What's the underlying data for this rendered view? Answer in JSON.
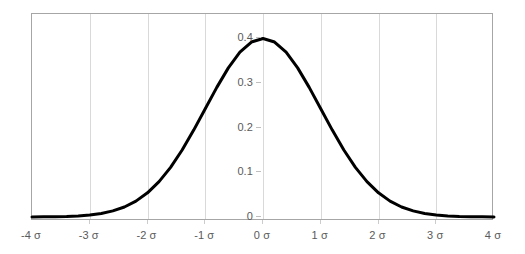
{
  "chart_data": {
    "type": "line",
    "title": "",
    "subtitle": "",
    "xlabel": "",
    "ylabel": "",
    "xlim": [
      -4,
      4
    ],
    "ylim": [
      0,
      0.42
    ],
    "grid": "vertical-only",
    "legend": "none",
    "series": [
      {
        "name": "standard normal pdf",
        "color": "#000000",
        "line_width": 3,
        "x": [
          -4,
          -3.8,
          -3.6,
          -3.4,
          -3.2,
          -3,
          -2.8,
          -2.6,
          -2.4,
          -2.2,
          -2,
          -1.8,
          -1.6,
          -1.4,
          -1.2,
          -1,
          -0.8,
          -0.6,
          -0.4,
          -0.2,
          0,
          0.2,
          0.4,
          0.6,
          0.8,
          1,
          1.2,
          1.4,
          1.6,
          1.8,
          2,
          2.2,
          2.4,
          2.6,
          2.8,
          3,
          3.2,
          3.4,
          3.6,
          3.8,
          4
        ],
        "values": [
          0.0001,
          0.0003,
          0.0006,
          0.0012,
          0.0024,
          0.0044,
          0.0079,
          0.0136,
          0.0224,
          0.0355,
          0.054,
          0.079,
          0.1109,
          0.1497,
          0.1942,
          0.242,
          0.2897,
          0.3332,
          0.3683,
          0.391,
          0.3989,
          0.391,
          0.3683,
          0.3332,
          0.2897,
          0.242,
          0.1942,
          0.1497,
          0.1109,
          0.079,
          0.054,
          0.0355,
          0.0224,
          0.0136,
          0.0079,
          0.0044,
          0.0024,
          0.0012,
          0.0006,
          0.0003,
          0.0001
        ]
      }
    ],
    "x_ticks": [
      {
        "value": -4,
        "label": "-4 σ"
      },
      {
        "value": -3,
        "label": "-3 σ"
      },
      {
        "value": -2,
        "label": "-2 σ"
      },
      {
        "value": -1,
        "label": "-1 σ"
      },
      {
        "value": 0,
        "label": "0 σ"
      },
      {
        "value": 1,
        "label": "1 σ"
      },
      {
        "value": 2,
        "label": "2 σ"
      },
      {
        "value": 3,
        "label": "3 σ"
      },
      {
        "value": 4,
        "label": "4 σ"
      }
    ],
    "y_ticks": [
      {
        "value": 0.4,
        "label": "0.4"
      },
      {
        "value": 0.3,
        "label": "0.3"
      },
      {
        "value": 0.2,
        "label": "0.2"
      },
      {
        "value": 0.1,
        "label": "0.1"
      },
      {
        "value": 0,
        "label": "0"
      }
    ],
    "colors": {
      "curve": "#000000",
      "gridline": "#d9d9d9",
      "plot_border": "#a6a6a6",
      "tick_label": "#5a5a5a",
      "background": "#ffffff"
    }
  }
}
